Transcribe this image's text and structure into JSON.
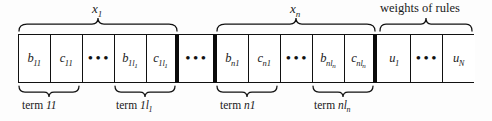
{
  "figure": {
    "caption": "Chromosome encoding strip for fuzzy rule parameters and rule weights",
    "colors": {
      "line": "#111111",
      "thick_separator": "#0a0a0a",
      "background": "#ffffff"
    }
  },
  "top_braces": [
    {
      "id": "brace-x1",
      "label_main": "x",
      "label_sub": "1",
      "label_text": "x1",
      "italic": true,
      "x": 18,
      "width": 160
    },
    {
      "id": "brace-xn",
      "label_main": "x",
      "label_sub": "n",
      "label_text": "xn",
      "italic": true,
      "x": 216,
      "width": 160
    },
    {
      "id": "brace-weights",
      "label_main": "weights of rules",
      "label_sub": "",
      "label_text": "weights of rules",
      "italic": false,
      "x": 378,
      "width": 96
    }
  ],
  "cells": [
    {
      "id": "cell-b11",
      "var": "b",
      "sub": "11",
      "subsub": "",
      "type": "variable",
      "sep": "thin"
    },
    {
      "id": "cell-c11",
      "var": "c",
      "sub": "11",
      "subsub": "",
      "type": "variable",
      "sep": "thin"
    },
    {
      "id": "cell-dots-term1",
      "var": "",
      "sub": "",
      "subsub": "",
      "type": "ellipsis",
      "text": "•••",
      "sep": "thin"
    },
    {
      "id": "cell-b1l1",
      "var": "b",
      "sub": "1l",
      "subsub": "1",
      "type": "variable",
      "sep": "thin"
    },
    {
      "id": "cell-c1l1",
      "var": "c",
      "sub": "1l",
      "subsub": "1",
      "type": "variable",
      "sep": "thick"
    },
    {
      "id": "cell-dots-vars",
      "var": "",
      "sub": "",
      "subsub": "",
      "type": "ellipsis",
      "text": "•••",
      "sep": "thick"
    },
    {
      "id": "cell-bn1",
      "var": "b",
      "sub": "n1",
      "subsub": "",
      "type": "variable",
      "sep": "thin"
    },
    {
      "id": "cell-cn1",
      "var": "c",
      "sub": "n1",
      "subsub": "",
      "type": "variable",
      "sep": "thin"
    },
    {
      "id": "cell-dots-termn",
      "var": "",
      "sub": "",
      "subsub": "",
      "type": "ellipsis",
      "text": "•••",
      "sep": "thin"
    },
    {
      "id": "cell-bnln",
      "var": "b",
      "sub": "nl",
      "subsub": "n",
      "type": "variable",
      "sep": "thin"
    },
    {
      "id": "cell-cnln",
      "var": "c",
      "sub": "nl",
      "subsub": "n",
      "type": "variable",
      "sep": "thick"
    },
    {
      "id": "cell-u1",
      "var": "u",
      "sub": "1",
      "subsub": "",
      "type": "weight",
      "sep": "thin"
    },
    {
      "id": "cell-dots-weights",
      "var": "",
      "sub": "",
      "subsub": "",
      "type": "ellipsis",
      "text": "•••",
      "sep": "thin"
    },
    {
      "id": "cell-uN",
      "var": "u",
      "sub": "N",
      "subsub": "",
      "type": "weight",
      "sep": "none"
    }
  ],
  "bottom_braces": [
    {
      "id": "brace-term11",
      "prefix": "term ",
      "main": "11",
      "sub": "",
      "label_text": "term 11",
      "x": 18,
      "width": 62
    },
    {
      "id": "brace-term1l1",
      "prefix": "term ",
      "main": "1l",
      "sub": "1",
      "label_text": "term 1l1",
      "x": 114,
      "width": 64
    },
    {
      "id": "brace-termn1",
      "prefix": "term ",
      "main": "n1",
      "sub": "",
      "label_text": "term n1",
      "x": 216,
      "width": 62
    },
    {
      "id": "brace-termnln",
      "prefix": "term ",
      "main": "nl",
      "sub": "n",
      "label_text": "term nln",
      "x": 312,
      "width": 64
    }
  ],
  "cell_geometry": {
    "strip_left": 18,
    "strip_top": 34,
    "strip_height": 49,
    "boundaries": [
      18,
      50,
      82,
      114,
      146,
      178,
      216,
      248,
      280,
      312,
      344,
      378,
      410,
      442,
      474
    ]
  }
}
